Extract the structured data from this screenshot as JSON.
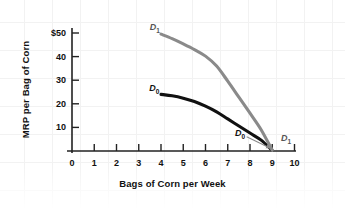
{
  "chart_data": {
    "type": "line",
    "title": "",
    "xlabel": "Bags of Corn per Week",
    "ylabel": "MRP per Bag of Corn",
    "xlim": [
      0,
      10.4
    ],
    "ylim": [
      0,
      55
    ],
    "grid": false,
    "legend": "none",
    "x_ticks": [
      "0",
      "1",
      "2",
      "3",
      "4",
      "5",
      "6",
      "7",
      "8",
      "9",
      "10"
    ],
    "x_tick_values": [
      0,
      1,
      2,
      3,
      4,
      5,
      6,
      7,
      8,
      9,
      10
    ],
    "y_ticks": [
      "10",
      "20",
      "30",
      "40",
      "$50"
    ],
    "y_tick_values": [
      10,
      20,
      30,
      40,
      50
    ],
    "series": [
      {
        "name": "D0",
        "label": "D",
        "subscript": "0",
        "color": "#111111",
        "width": 3.1,
        "points": [
          {
            "x": 4.0,
            "y": 24.0
          },
          {
            "x": 4.5,
            "y": 23.4
          },
          {
            "x": 5.0,
            "y": 22.4
          },
          {
            "x": 5.5,
            "y": 21.0
          },
          {
            "x": 6.0,
            "y": 19.0
          },
          {
            "x": 6.5,
            "y": 16.6
          },
          {
            "x": 7.0,
            "y": 13.6
          },
          {
            "x": 7.5,
            "y": 10.6
          },
          {
            "x": 8.0,
            "y": 7.6
          },
          {
            "x": 8.5,
            "y": 4.6
          },
          {
            "x": 9.0,
            "y": 0.3
          }
        ]
      },
      {
        "name": "D1",
        "label": "D",
        "subscript": "1",
        "color": "#8a8a8a",
        "width": 3.1,
        "points": [
          {
            "x": 4.0,
            "y": 49.5
          },
          {
            "x": 4.5,
            "y": 47.6
          },
          {
            "x": 5.0,
            "y": 45.4
          },
          {
            "x": 5.5,
            "y": 43.0
          },
          {
            "x": 6.0,
            "y": 40.2
          },
          {
            "x": 6.5,
            "y": 36.0
          },
          {
            "x": 7.0,
            "y": 29.6
          },
          {
            "x": 7.5,
            "y": 22.8
          },
          {
            "x": 8.0,
            "y": 16.0
          },
          {
            "x": 8.5,
            "y": 9.0
          },
          {
            "x": 9.0,
            "y": 0.3
          }
        ]
      }
    ],
    "annotations": [
      {
        "name": "d1-top-label",
        "text": "D",
        "sub": "1",
        "x": 3.72,
        "y": 52.0,
        "color": "#555555"
      },
      {
        "name": "d0-top-label",
        "text": "D",
        "sub": "0",
        "x": 3.7,
        "y": 26.4,
        "color": "#111111"
      },
      {
        "name": "d0-pointer-label",
        "text": "D",
        "sub": "0",
        "x": 7.55,
        "y": 7.2,
        "color": "#111111"
      },
      {
        "name": "d1-end-label",
        "text": "D",
        "sub": "1",
        "x": 9.62,
        "y": 5.1,
        "color": "#555555"
      }
    ],
    "leader_line": {
      "name": "d0-leader-arrow",
      "color": "#8a8a8a",
      "from": {
        "x": 7.85,
        "y": 6.0
      },
      "to": {
        "x": 8.92,
        "y": 1.2
      }
    }
  }
}
